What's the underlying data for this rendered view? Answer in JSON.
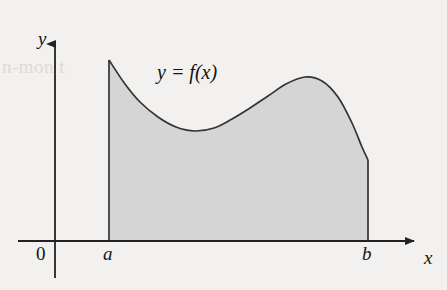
{
  "figure": {
    "type": "area-under-curve-diagram",
    "background_color": "#f2f1ef",
    "ghost_text": "n-mon\nto v\nemir",
    "region_fill_color": "#d5d5d5",
    "stroke_color": "#333333"
  },
  "labels": {
    "y_axis": "y",
    "x_axis": "x",
    "origin": "0",
    "left_bound": "a",
    "right_bound": "b",
    "curve": "y = f(x)"
  },
  "chart_data": {
    "type": "area",
    "title": "",
    "xlabel": "x",
    "ylabel": "y",
    "curve_label": "y = f(x)",
    "grid": false,
    "legend": "none",
    "x_bounds": {
      "left_label": "a",
      "right_label": "b"
    },
    "axes": {
      "x_axis_y_px": 241,
      "y_axis_x_px": 55,
      "x_axis_arrow_x_px": 420,
      "y_axis_arrow_y_px": 36,
      "y_axis_bottom_px": 278
    },
    "region": {
      "left_edge_x_px": 109,
      "right_edge_x_px": 368,
      "baseline_y_px": 241,
      "left_edge_top_y_px": 60,
      "right_edge_top_y_px": 160
    },
    "curve_points_px": [
      {
        "x": 109,
        "y": 60
      },
      {
        "x": 125,
        "y": 84
      },
      {
        "x": 140,
        "y": 102
      },
      {
        "x": 158,
        "y": 117
      },
      {
        "x": 176,
        "y": 127
      },
      {
        "x": 195,
        "y": 131
      },
      {
        "x": 214,
        "y": 128
      },
      {
        "x": 232,
        "y": 119
      },
      {
        "x": 250,
        "y": 108
      },
      {
        "x": 268,
        "y": 96
      },
      {
        "x": 286,
        "y": 84
      },
      {
        "x": 305,
        "y": 77
      },
      {
        "x": 322,
        "y": 81
      },
      {
        "x": 338,
        "y": 97
      },
      {
        "x": 352,
        "y": 123
      },
      {
        "x": 362,
        "y": 147
      },
      {
        "x": 368,
        "y": 160
      }
    ]
  }
}
